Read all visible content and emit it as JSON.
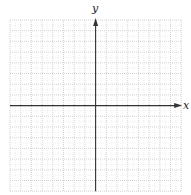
{
  "figure": {
    "type": "coordinate-plane",
    "x_axis_label": "x",
    "y_axis_label": "y",
    "grid": {
      "columns": 16,
      "rows": 16,
      "left": 10,
      "top": 20,
      "cell_size": 10.7,
      "line_color": "#c8c8c8",
      "line_style": "dotted"
    },
    "axis_color": "#333333",
    "origin_column": 8,
    "origin_row": 8,
    "arrows": [
      "positive-x",
      "positive-y"
    ]
  }
}
